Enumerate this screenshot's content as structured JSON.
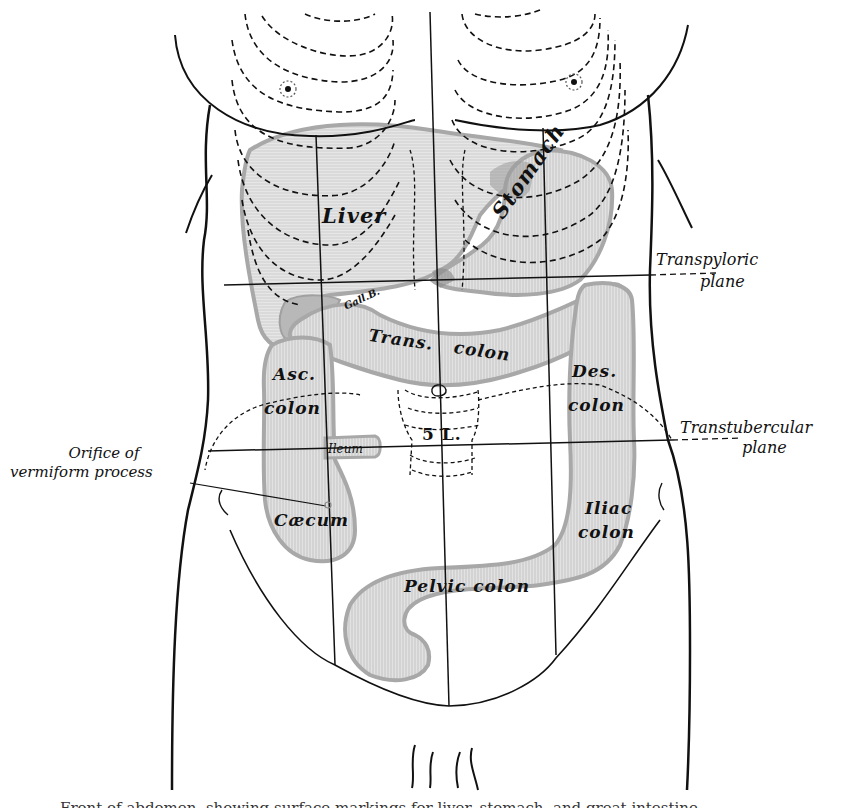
{
  "figure": {
    "colors": {
      "outline": "#111111",
      "organ_fill": "#d6d6d6",
      "organ_edge": "#a8a8a8",
      "stomach_dark": "#9a9a9a",
      "background": "#ffffff"
    },
    "organs": {
      "liver": "Liver",
      "stomach": "Stomach",
      "gall_bladder": "Gall.B.",
      "transverse_colon": "Trans.   colon",
      "ascending_colon_1": "Asc.",
      "ascending_colon_2": "colon",
      "descending_colon_1": "Des.",
      "descending_colon_2": "colon",
      "ileum": "Ileum",
      "caecum": "Cæcum",
      "iliac_colon_1": "Iliac",
      "iliac_colon_2": "colon",
      "pelvic_colon": "Pelvic colon",
      "vertebra": "5 L."
    },
    "planes": {
      "transpyloric_1": "Transpyloric",
      "transpyloric_2": "plane",
      "transtubercular_1": "Transtubercular",
      "transtubercular_2": "plane"
    },
    "annotations": {
      "orifice_1": "Orifice of",
      "orifice_2": "vermiform process"
    },
    "caption": "Front of abdomen, showing surface markings for liver, stomach, and great intestine."
  }
}
